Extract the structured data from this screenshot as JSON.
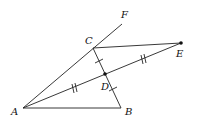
{
  "diagram": {
    "type": "geometry",
    "points": {
      "A": {
        "label": "A",
        "x": 23,
        "y": 108
      },
      "B": {
        "label": "B",
        "x": 121,
        "y": 108
      },
      "C": {
        "label": "C",
        "x": 93,
        "y": 48
      },
      "D": {
        "label": "D",
        "x": 105,
        "y": 74
      },
      "E": {
        "label": "E",
        "x": 181,
        "y": 43
      },
      "F": {
        "label": "F",
        "x": 122,
        "y": 24
      }
    },
    "segments": [
      "AB",
      "BC",
      "CE",
      "AE",
      "AF"
    ],
    "marks": {
      "single_tick": [
        "CD",
        "DB"
      ],
      "double_tick": [
        "AD",
        "DE"
      ]
    },
    "dots": [
      "D",
      "E"
    ],
    "colors": {
      "stroke": "#222222",
      "text": "#111111",
      "background": "#ffffff"
    }
  }
}
